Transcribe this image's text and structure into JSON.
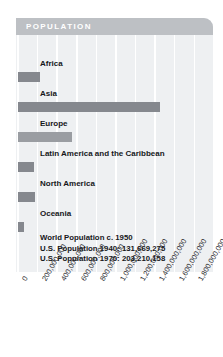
{
  "panel": {
    "header_title": "POPULATION",
    "accent_header": "#bdc0c4",
    "panel_bg": "#eef0f2",
    "bar_color": "#85888e",
    "gridline_color": "#ffffff"
  },
  "notes": {
    "line1": "World Population c. 1950",
    "line2": "U.S. Population 1940: 131,669,275",
    "line3": "U.S. Population 1970: 203,210,158"
  },
  "chart_data": {
    "type": "bar",
    "orientation": "horizontal",
    "title": "POPULATION",
    "xlabel": "",
    "ylabel": "",
    "xlim": [
      0,
      1900000000
    ],
    "grid": true,
    "legend": false,
    "categories": [
      "Africa",
      "Asia",
      "Europe",
      "Latin America and the Caribbean",
      "North America",
      "Oceania"
    ],
    "values": [
      228000000,
      1450000000,
      547000000,
      167000000,
      172000000,
      13000000
    ],
    "xticks": [
      "0",
      "200,000,000",
      "400,000,000",
      "600,000,000",
      "800,000,000",
      "1,000,000,000",
      "1,200,000,000",
      "1,400,000,000",
      "1,600,000,000",
      "1,800,000,000"
    ],
    "xtick_values": [
      0,
      200000000,
      400000000,
      600000000,
      800000000,
      1000000000,
      1200000000,
      1400000000,
      1600000000,
      1800000000
    ],
    "annotations": [
      "World Population c. 1950",
      "U.S. Population 1940: 131,669,275",
      "U.S. Population 1970: 203,210,158"
    ]
  }
}
